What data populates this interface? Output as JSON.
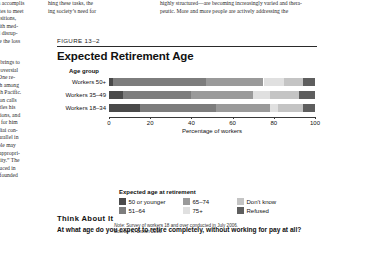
{
  "page": {
    "left_column_top": [
      "ors. In accomplis",
      "ntributes to meet",
      "al transitions,",
      "nce with med-",
      "inimal disrup-",
      "despite the loss"
    ],
    "left_column_bottom": [
      "alysis brings to",
      "t controversial",
      "ath.” One re-",
      "d death among",
      "e South Pacific.",
      "g person calls",
      "es, settles his",
      "ossessions, and",
      "s time for him",
      "he Kaliai con-",
      "as a parallel in",
      "e people may",
      "” an “appropri-",
      "h dignity.” The",
      "introduced in",
      "67, is founded"
    ],
    "mid_column_top": [
      "hing these tasks, the",
      "ing society’s need for"
    ],
    "right_column_top": [
      "highly structured—are becoming increasingly varied and thera-",
      "peutic. More and more people are actively addressing the"
    ]
  },
  "figure": {
    "number": "FIGURE 13–2",
    "title": "Expected Retirement Age",
    "note_label": "Note:",
    "note_text": " Survey of workers 18 and over conducted in July 2006.",
    "source_label": "Source:",
    "source_text": " K. Brown 2006."
  },
  "think_about_it": {
    "heading": "Think About It",
    "question": "At what age do you expect to retire completely, without working for pay at all?"
  },
  "chart_data": {
    "type": "bar",
    "orientation": "horizontal",
    "stacked": true,
    "title": "Expected Retirement Age",
    "xlabel": "Percentage of workers",
    "ylabel": "Age group",
    "xlim": [
      0,
      100
    ],
    "xticks": [
      0,
      20,
      40,
      60,
      80,
      100
    ],
    "grid": false,
    "legend_title": "Expected age at retirement",
    "legend_position": "below",
    "categories": [
      "Workers 50+",
      "Workers 35–49",
      "Workers 18–34"
    ],
    "series": [
      {
        "name": "50 or younger",
        "color": "#4a4a4a",
        "values": [
          2,
          7,
          15
        ]
      },
      {
        "name": "51–64",
        "color": "#7d7d7d",
        "values": [
          45,
          33,
          37
        ]
      },
      {
        "name": "65–74",
        "color": "#9a9a9a",
        "values": [
          28,
          30,
          26
        ]
      },
      {
        "name": "75+",
        "color": "#e0e0e0",
        "values": [
          10,
          8,
          4
        ]
      },
      {
        "name": "Don’t know",
        "color": "#c4c4c4",
        "values": [
          9,
          14,
          12
        ]
      },
      {
        "name": "Refused",
        "color": "#5e5e5e",
        "values": [
          6,
          8,
          6
        ]
      }
    ]
  }
}
